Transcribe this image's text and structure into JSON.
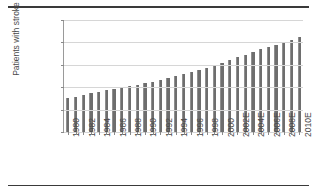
{
  "chart_data": {
    "type": "bar",
    "title": "",
    "xlabel": "",
    "ylabel": "Patients with stroke",
    "ylim": [
      3000000,
      5500000
    ],
    "ytick_step": 500000,
    "ytick_labels": [
      "3,000,000",
      "3,500,000",
      "4,000,000",
      "4,500,000",
      "5,000,000",
      "5,500,000"
    ],
    "ytick_values": [
      3000000,
      3500000,
      4000000,
      4500000,
      5000000,
      5500000
    ],
    "grid": true,
    "legend": "none",
    "bar_color": "#6e6e6e",
    "categories": [
      "1980",
      "1981",
      "1982",
      "1983",
      "1984",
      "1985",
      "1986",
      "1987",
      "1988",
      "1989",
      "1990",
      "1991",
      "1992",
      "1993",
      "1994",
      "1995",
      "1996",
      "1997",
      "1998",
      "1999",
      "2000",
      "2001E",
      "2002E",
      "2003E",
      "2004E",
      "2005E",
      "2006E",
      "2007E",
      "2008E",
      "2009E",
      "2010E"
    ],
    "xtick_labels_shown": [
      "1980",
      "1982",
      "1984",
      "1986",
      "1988",
      "1990",
      "1992",
      "1994",
      "1996",
      "1998",
      "2000",
      "2002E",
      "2004E",
      "2006E",
      "2008E",
      "2010E"
    ],
    "values": [
      3750000,
      3790000,
      3830000,
      3870000,
      3900000,
      3930000,
      3960000,
      4000000,
      4030000,
      4060000,
      4090000,
      4120000,
      4160000,
      4200000,
      4240000,
      4290000,
      4340000,
      4390000,
      4440000,
      4490000,
      4550000,
      4610000,
      4670000,
      4730000,
      4790000,
      4850000,
      4900000,
      4950000,
      5000000,
      5050000,
      5130000
    ]
  }
}
